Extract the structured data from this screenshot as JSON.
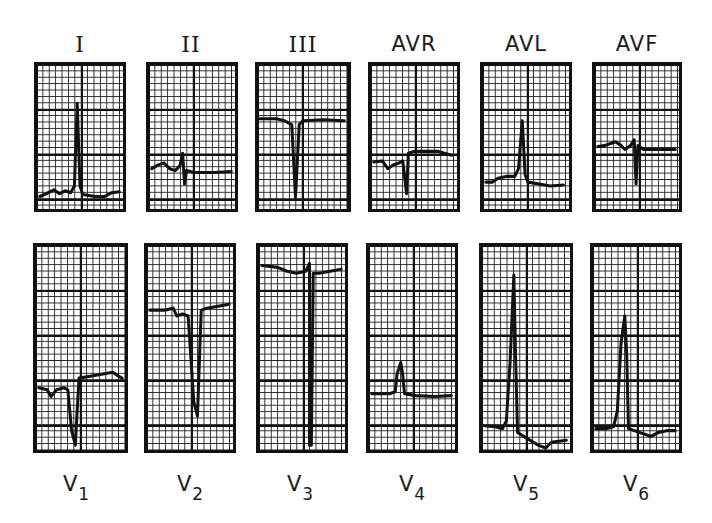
{
  "figure": {
    "colors": {
      "ink": "#111111",
      "paper": "#ffffff"
    },
    "limb_leads": [
      {
        "id": "I",
        "label": "I",
        "box": [
          34,
          62,
          92,
          150
        ],
        "label_x": 30,
        "label_y": 32,
        "trace": "M3,137 L10,134 L18,130 L24,134 L30,131 L36,133 L40,126 L43,40 L46,126 L49,135 L62,137 L72,137 L80,133 L88,132"
      },
      {
        "id": "II",
        "label": "II",
        "box": [
          146,
          62,
          92,
          150
        ],
        "label_x": 141,
        "label_y": 32,
        "trace": "M3,108 L10,104 L16,102 L22,108 L28,110 L33,105 L36,92 L38,124 L40,110 L48,112 L70,112 L88,111"
      },
      {
        "id": "III",
        "label": "III",
        "box": [
          255,
          62,
          96,
          150
        ],
        "label_x": 253,
        "label_y": 32,
        "trace": "M2,56 L20,56 L28,58 L36,62 L40,138 L44,62 L48,58 L70,57 L92,58"
      },
      {
        "id": "AVR",
        "label": "AVR",
        "box": [
          368,
          62,
          92,
          150
        ],
        "label_x": 364,
        "label_y": 32,
        "trace": "M3,101 L12,100 L18,108 L24,104 L30,102 L34,100 L38,134 L40,92 L46,90 L72,90 L86,94"
      },
      {
        "id": "AVL",
        "label": "AVL",
        "box": [
          480,
          62,
          92,
          150
        ],
        "label_x": 476,
        "label_y": 32,
        "trace": "M3,122 L10,122 L16,118 L26,116 L34,116 L38,108 L42,58 L45,114 L48,122 L60,124 L72,126 L86,125"
      },
      {
        "id": "AVF",
        "label": "AVF",
        "box": [
          592,
          62,
          90,
          150
        ],
        "label_x": 587,
        "label_y": 32,
        "trace": "M3,85 L10,84 L16,82 L22,80 L28,84 L32,88 L38,84 L42,78 L44,124 L46,84 L52,88 L64,88 L86,88"
      }
    ],
    "chest_leads": [
      {
        "id": "V1",
        "label": "V",
        "sub": "1",
        "box": [
          33,
          243,
          95,
          210
        ],
        "label_x": 26,
        "label_y": 472,
        "trace": "M3,146 L12,148 L16,155 L22,148 L30,146 L34,148 L38,190 L42,205 L44,168 L46,136 L58,134 L70,132 L82,130 L88,134 L92,136"
      },
      {
        "id": "V2",
        "label": "V",
        "sub": "2",
        "box": [
          144,
          243,
          92,
          210
        ],
        "label_x": 140,
        "label_y": 472,
        "trace": "M3,66 L20,66 L28,64 L32,72 L38,70 L44,72 L50,160 L54,175 L56,120 L58,66 L64,64 L76,62 L88,60"
      },
      {
        "id": "V3",
        "label": "V",
        "sub": "3",
        "box": [
          256,
          243,
          92,
          210
        ],
        "label_x": 250,
        "label_y": 472,
        "trace": "M3,20 L20,22 L30,26 L40,28 L50,26 L54,18 L54,205 L56,205 L58,28 L64,28 L76,26 L88,24"
      },
      {
        "id": "V4",
        "label": "V",
        "sub": "4",
        "box": [
          366,
          243,
          92,
          210
        ],
        "label_x": 362,
        "label_y": 472,
        "trace": "M3,152 L12,152 L22,152 L28,150 L30,132 L34,120 L36,132 L38,152 L50,154 L70,155 L88,154"
      },
      {
        "id": "V5",
        "label": "V",
        "sub": "5",
        "box": [
          479,
          243,
          94,
          210
        ],
        "label_x": 476,
        "label_y": 472,
        "trace": "M3,185 L14,186 L22,188 L26,180 L30,120 L34,30 L36,120 L38,192 L48,198 L60,205 L68,208 L74,202 L90,200"
      },
      {
        "id": "V6",
        "label": "V",
        "sub": "6",
        "box": [
          590,
          243,
          92,
          210
        ],
        "label_x": 586,
        "label_y": 472,
        "trace": "M3,188 L14,188 L22,186 L26,170 L30,100 L34,72 L36,110 L38,188 L50,192 L62,196 L70,192 L80,190 L88,190"
      }
    ]
  }
}
